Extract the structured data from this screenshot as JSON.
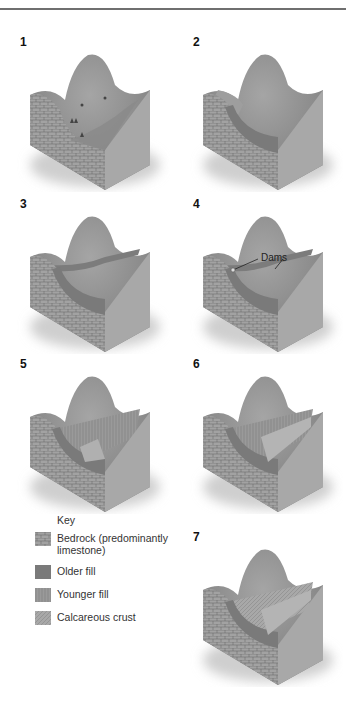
{
  "figure": {
    "panels": [
      {
        "number": "1"
      },
      {
        "number": "2"
      },
      {
        "number": "3"
      },
      {
        "number": "4",
        "annotation": "Dams"
      },
      {
        "number": "5"
      },
      {
        "number": "6"
      },
      {
        "number": "7"
      }
    ],
    "key": {
      "title": "Key",
      "items": [
        {
          "label": "Bedrock (predominantly limestone)",
          "pattern": "brick",
          "color": "#8a8a8a"
        },
        {
          "label": "Older fill",
          "pattern": "solid",
          "color": "#7a7a7a"
        },
        {
          "label": "Younger fill",
          "pattern": "vertical-lines",
          "color": "#959595"
        },
        {
          "label": "Calcareous crust",
          "pattern": "diagonal",
          "color": "#a3a3a3"
        }
      ]
    },
    "colors": {
      "bedrock": "#9a9a9a",
      "surface": "#8c8c8c",
      "older_fill": "#7a7a7a",
      "younger_fill": "#a0a0a0",
      "shadow": "#d0d0d0"
    }
  }
}
